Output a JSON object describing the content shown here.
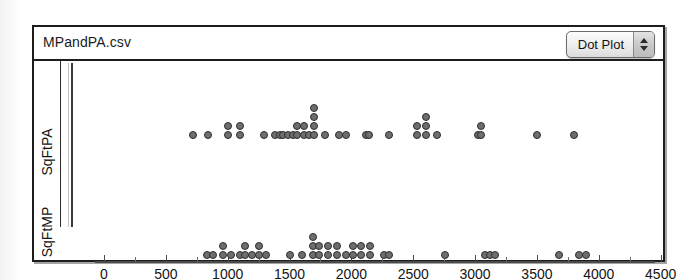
{
  "window": {
    "title": "MPandPA.csv"
  },
  "toolbar": {
    "plot_type_label": "Dot Plot",
    "stepper_up_icon": "triangle-up-icon",
    "stepper_down_icon": "triangle-down-icon"
  },
  "axes": {
    "group_labels": [
      "SqFtPA",
      "SqFtMP"
    ],
    "x_ticks": [
      0,
      500,
      1000,
      1500,
      2000,
      2500,
      3000,
      3500,
      4000,
      4500
    ],
    "x_tick_labels": [
      "0",
      "500",
      "1000",
      "1500",
      "2000",
      "2500",
      "3000",
      "3500",
      "4000",
      "4500"
    ],
    "x_min": 0,
    "x_max": 4700,
    "minor_tick_step": 250
  },
  "colors": {
    "dot_fill": "#6e6e6e",
    "dot_stroke": "#2e2e2e",
    "frame": "#1d1d1d",
    "axis": "#4a4a4a",
    "background": "#ffffff"
  },
  "chart_data": {
    "type": "scatter",
    "title": "MPandPA.csv",
    "xlabel": "",
    "ylabel": "",
    "xlim": [
      0,
      4700
    ],
    "grid": false,
    "legend": "none",
    "plot_style": "dot plot (stacked dots)",
    "series": [
      {
        "name": "SqFtPA",
        "row": 0,
        "values": [
          720,
          840,
          1000,
          1000,
          1100,
          1100,
          1290,
          1380,
          1420,
          1450,
          1490,
          1530,
          1560,
          1570,
          1600,
          1620,
          1640,
          1660,
          1700,
          1700,
          1700,
          1700,
          1740,
          1790,
          1900,
          1960,
          2000,
          2120,
          2140,
          2140,
          2140,
          2300,
          2530,
          2600,
          2620,
          2650,
          2690,
          3020,
          3050,
          3500,
          3800
        ],
        "stacks": [
          {
            "x": 720,
            "count": 1
          },
          {
            "x": 840,
            "count": 1
          },
          {
            "x": 1000,
            "count": 2
          },
          {
            "x": 1100,
            "count": 2
          },
          {
            "x": 1290,
            "count": 1
          },
          {
            "x": 1380,
            "count": 1
          },
          {
            "x": 1420,
            "count": 1
          },
          {
            "x": 1450,
            "count": 1
          },
          {
            "x": 1490,
            "count": 1
          },
          {
            "x": 1530,
            "count": 1
          },
          {
            "x": 1560,
            "count": 2
          },
          {
            "x": 1620,
            "count": 2
          },
          {
            "x": 1660,
            "count": 1
          },
          {
            "x": 1700,
            "count": 4
          },
          {
            "x": 1790,
            "count": 1
          },
          {
            "x": 1900,
            "count": 1
          },
          {
            "x": 1960,
            "count": 1
          },
          {
            "x": 2120,
            "count": 1
          },
          {
            "x": 2140,
            "count": 1
          },
          {
            "x": 2300,
            "count": 1
          },
          {
            "x": 2530,
            "count": 2
          },
          {
            "x": 2600,
            "count": 3
          },
          {
            "x": 2690,
            "count": 1
          },
          {
            "x": 3020,
            "count": 1
          },
          {
            "x": 3050,
            "count": 2
          },
          {
            "x": 3500,
            "count": 1
          },
          {
            "x": 3800,
            "count": 1
          }
        ]
      },
      {
        "name": "SqFtMP",
        "row": 1,
        "values": [
          830,
          880,
          960,
          980,
          1030,
          1100,
          1140,
          1140,
          1200,
          1250,
          1250,
          1310,
          1340,
          1500,
          1600,
          1690,
          1690,
          1690,
          1740,
          1740,
          1810,
          1810,
          1880,
          1920,
          1960,
          2010,
          2080,
          2120,
          2150,
          2200,
          2260,
          2300,
          2760,
          3080,
          3120,
          3160,
          3680,
          3840,
          3900
        ],
        "stacks": [
          {
            "x": 830,
            "count": 1
          },
          {
            "x": 880,
            "count": 1
          },
          {
            "x": 960,
            "count": 2
          },
          {
            "x": 1030,
            "count": 1
          },
          {
            "x": 1100,
            "count": 1
          },
          {
            "x": 1140,
            "count": 2
          },
          {
            "x": 1200,
            "count": 1
          },
          {
            "x": 1250,
            "count": 2
          },
          {
            "x": 1310,
            "count": 1
          },
          {
            "x": 1500,
            "count": 1
          },
          {
            "x": 1600,
            "count": 1
          },
          {
            "x": 1690,
            "count": 3
          },
          {
            "x": 1740,
            "count": 2
          },
          {
            "x": 1810,
            "count": 2
          },
          {
            "x": 1880,
            "count": 2
          },
          {
            "x": 1960,
            "count": 1
          },
          {
            "x": 2010,
            "count": 2
          },
          {
            "x": 2080,
            "count": 2
          },
          {
            "x": 2150,
            "count": 2
          },
          {
            "x": 2260,
            "count": 1
          },
          {
            "x": 2300,
            "count": 1
          },
          {
            "x": 2760,
            "count": 1
          },
          {
            "x": 3080,
            "count": 1
          },
          {
            "x": 3120,
            "count": 1
          },
          {
            "x": 3160,
            "count": 1
          },
          {
            "x": 3680,
            "count": 1
          },
          {
            "x": 3840,
            "count": 1
          },
          {
            "x": 3900,
            "count": 1
          }
        ]
      }
    ]
  }
}
